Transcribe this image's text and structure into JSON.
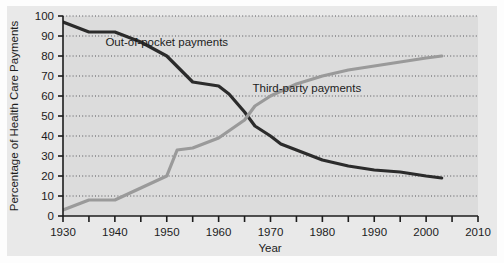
{
  "chart_data": {
    "type": "line",
    "title": "",
    "xlabel": "Year",
    "ylabel": "Percentage of Health Care Payments",
    "xlim": [
      1930,
      2010
    ],
    "ylim": [
      0,
      100
    ],
    "xticks": [
      1930,
      1935,
      1940,
      1945,
      1950,
      1955,
      1960,
      1965,
      1970,
      1975,
      1980,
      1985,
      1990,
      1995,
      2000,
      2005,
      2010
    ],
    "xtick_labels": [
      "1930",
      "",
      "1940",
      "",
      "1950",
      "",
      "1960",
      "",
      "1970",
      "",
      "1980",
      "",
      "1990",
      "",
      "2000",
      "",
      "2010"
    ],
    "yticks": [
      0,
      10,
      20,
      30,
      40,
      50,
      60,
      70,
      80,
      90,
      100
    ],
    "ytick_labels": [
      "0",
      "10",
      "20",
      "30",
      "40",
      "50",
      "60",
      "70",
      "80",
      "90",
      "100"
    ],
    "grid": "horizontal-dotted",
    "legend_position": "inline-annotations",
    "series": [
      {
        "name": "Out-of-pocket payments",
        "color": "#2b2b2b",
        "label_x": 1950,
        "label_y": 85,
        "x": [
          1930,
          1935,
          1940,
          1945,
          1950,
          1955,
          1960,
          1962,
          1965,
          1967,
          1970,
          1972,
          1975,
          1980,
          1985,
          1990,
          1995,
          2000,
          2003
        ],
        "values": [
          97,
          92,
          92,
          87,
          80,
          67,
          65,
          61,
          52,
          45,
          40,
          36,
          33,
          28,
          25,
          23,
          22,
          20,
          19
        ]
      },
      {
        "name": "Third-party payments",
        "color": "#9a9a9a",
        "label_x": 1977,
        "label_y": 62,
        "x": [
          1930,
          1935,
          1940,
          1945,
          1950,
          1952,
          1955,
          1960,
          1965,
          1967,
          1970,
          1975,
          1980,
          1985,
          1990,
          1995,
          2000,
          2003
        ],
        "values": [
          3,
          8,
          8,
          14,
          20,
          33,
          34,
          39,
          48,
          55,
          60,
          66,
          70,
          73,
          75,
          77,
          79,
          80
        ]
      }
    ]
  },
  "figure": {
    "background_color": "#e9e9e9",
    "axis_color": "#1c1c1c",
    "grid_color": "#55555a"
  }
}
